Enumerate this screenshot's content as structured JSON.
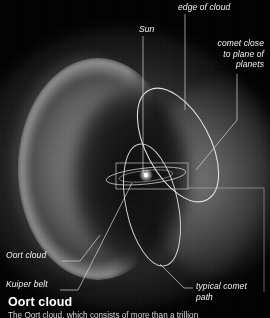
{
  "figure": {
    "background_color": "#000000",
    "ink_color": "#f2f2f2"
  },
  "labels": {
    "sun": "Sun",
    "edge_of_cloud": "edge of cloud",
    "comet_close_to_plane": "comet close\nto plane of\nplanets",
    "oort_cloud": "Oort cloud",
    "kuiper_belt": "Kuiper belt",
    "typical_comet_path": "typical comet\npath"
  },
  "caption": {
    "title": "Oort cloud",
    "body": "The Oort cloud, which consists of more than a trillion"
  }
}
